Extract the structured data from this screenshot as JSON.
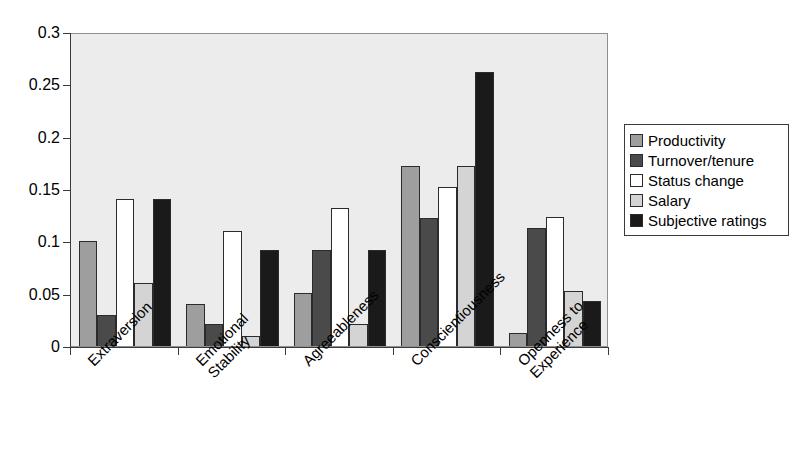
{
  "chart_data": {
    "type": "bar",
    "title": "",
    "xlabel": "",
    "ylabel": "",
    "ylim": [
      0,
      0.3
    ],
    "yticks": [
      "0",
      "0.05",
      "0.1",
      "0.15",
      "0.2",
      "0.25",
      "0.3"
    ],
    "ytick_values": [
      0,
      0.05,
      0.1,
      0.15,
      0.2,
      0.25,
      0.3
    ],
    "grid": false,
    "legend_position": "right",
    "categories": [
      "Extraversion",
      "Emotional\nStability",
      "Agreeableness",
      "Conscientiousness",
      "Openness to\nExperience"
    ],
    "series": [
      {
        "name": "Productivity",
        "color": "#9e9e9e",
        "values": [
          0.1,
          0.04,
          0.051,
          0.172,
          0.012
        ]
      },
      {
        "name": "Turnover/tenure",
        "color": "#4a4a4a",
        "values": [
          0.03,
          0.021,
          0.092,
          0.122,
          0.113
        ]
      },
      {
        "name": "Status change",
        "color": "#ffffff",
        "values": [
          0.14,
          0.11,
          0.132,
          0.152,
          0.123
        ]
      },
      {
        "name": "Salary",
        "color": "#d4d4d4",
        "values": [
          0.06,
          0.01,
          0.021,
          0.172,
          0.053
        ]
      },
      {
        "name": "Subjective ratings",
        "color": "#1a1a1a",
        "values": [
          0.14,
          0.092,
          0.092,
          0.262,
          0.043
        ]
      }
    ]
  },
  "legend": {
    "items": [
      {
        "label": "Productivity"
      },
      {
        "label": "Turnover/tenure"
      },
      {
        "label": "Status change"
      },
      {
        "label": "Salary"
      },
      {
        "label": "Subjective ratings"
      }
    ]
  },
  "colors": {
    "plot_background": "#ececec",
    "axis": "#3a3a3a",
    "bar_outline": "#2b2b2b",
    "page_background": "#ffffff"
  }
}
